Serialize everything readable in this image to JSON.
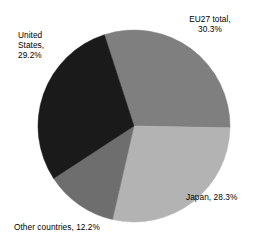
{
  "chart_data": {
    "type": "pie",
    "title": "",
    "subtitle": "",
    "xlabel": "",
    "ylabel": "",
    "legend_position": "none",
    "grid": false,
    "labels_outside": true,
    "total_percent": 100.0,
    "units": "percent",
    "categories": [
      "EU27 total",
      "Japan",
      "Other countries",
      "United States"
    ],
    "values": [
      30.3,
      28.3,
      12.2,
      29.2
    ],
    "slices": [
      {
        "name": "EU27 total",
        "value": 30.3,
        "value_text": "30.3%",
        "label_text": "EU27 total,\n30.3%",
        "color": "#807f80",
        "start_angle_deg": -18.0,
        "end_angle_deg": 91.08
      },
      {
        "name": "Japan",
        "value": 28.3,
        "value_text": "28.3%",
        "label_text": "Japan, 28.3%",
        "color": "#b3b3b3",
        "start_angle_deg": 91.08,
        "end_angle_deg": 192.96
      },
      {
        "name": "Other countries",
        "value": 12.2,
        "value_text": "12.2%",
        "label_text": "Other countries, 12.2%",
        "color": "#6e6e6e",
        "start_angle_deg": 192.96,
        "end_angle_deg": 236.88
      },
      {
        "name": "United States",
        "value": 29.2,
        "value_text": "29.2%",
        "label_text": "United\nStates,\n29.2%",
        "color": "#1a1a1a",
        "start_angle_deg": 236.88,
        "end_angle_deg": 342.0
      }
    ],
    "geometry": {
      "center_x": 134,
      "center_y": 126,
      "radius": 96
    }
  }
}
